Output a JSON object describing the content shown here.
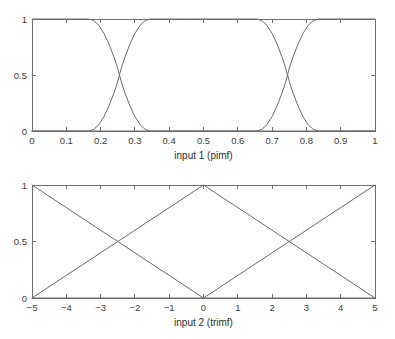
{
  "figure": {
    "background": "#ffffff",
    "line_color": "#6a6a6a",
    "axis_color": "#6f6f6f",
    "text_color": "#3a3a3a",
    "width": 395,
    "height": 339
  },
  "chart_data": [
    {
      "id": "input1",
      "type": "line",
      "title": "",
      "xlabel": "input 1 (pimf)",
      "ylabel": "",
      "xlim": [
        0,
        1
      ],
      "ylim": [
        0,
        1
      ],
      "xticks": [
        0,
        0.1,
        0.2,
        0.3,
        0.4,
        0.5,
        0.6,
        0.7,
        0.8,
        0.9,
        1
      ],
      "xticklabels": [
        "0",
        "0.1",
        "0.2",
        "0.3",
        "0.4",
        "0.5",
        "0.6",
        "0.7",
        "0.8",
        "0.9",
        "1"
      ],
      "yticks": [
        0,
        0.5,
        1
      ],
      "yticklabels": [
        "0",
        "0.5",
        "1"
      ],
      "grid": false,
      "legend": false,
      "mf_type": "pimf",
      "series": [
        {
          "name": "pimf-low",
          "mf_params": [
            -0.35,
            -0.1,
            0.165,
            0.345
          ],
          "points": [
            [
              0.0,
              1.0
            ],
            [
              0.05,
              1.0
            ],
            [
              0.1,
              1.0
            ],
            [
              0.14,
              1.0
            ],
            [
              0.165,
              1.0
            ],
            [
              0.18,
              0.986
            ],
            [
              0.195,
              0.943
            ],
            [
              0.21,
              0.871
            ],
            [
              0.225,
              0.772
            ],
            [
              0.24,
              0.652
            ],
            [
              0.2475,
              0.585
            ],
            [
              0.255,
              0.5
            ],
            [
              0.2625,
              0.418
            ],
            [
              0.27,
              0.348
            ],
            [
              0.285,
              0.228
            ],
            [
              0.3,
              0.129
            ],
            [
              0.315,
              0.057
            ],
            [
              0.33,
              0.014
            ],
            [
              0.345,
              0.0
            ],
            [
              0.4,
              0.0
            ],
            [
              0.5,
              0.0
            ],
            [
              0.7,
              0.0
            ],
            [
              1.0,
              0.0
            ]
          ]
        },
        {
          "name": "pimf-mid",
          "mf_params": [
            0.165,
            0.345,
            0.655,
            0.835
          ],
          "points": [
            [
              0.0,
              0.0
            ],
            [
              0.1,
              0.0
            ],
            [
              0.165,
              0.0
            ],
            [
              0.18,
              0.014
            ],
            [
              0.195,
              0.057
            ],
            [
              0.21,
              0.129
            ],
            [
              0.225,
              0.228
            ],
            [
              0.24,
              0.348
            ],
            [
              0.2475,
              0.418
            ],
            [
              0.255,
              0.5
            ],
            [
              0.2625,
              0.585
            ],
            [
              0.27,
              0.652
            ],
            [
              0.285,
              0.772
            ],
            [
              0.3,
              0.871
            ],
            [
              0.315,
              0.943
            ],
            [
              0.33,
              0.986
            ],
            [
              0.345,
              1.0
            ],
            [
              0.45,
              1.0
            ],
            [
              0.5,
              1.0
            ],
            [
              0.6,
              1.0
            ],
            [
              0.655,
              1.0
            ],
            [
              0.67,
              0.986
            ],
            [
              0.685,
              0.943
            ],
            [
              0.7,
              0.871
            ],
            [
              0.715,
              0.772
            ],
            [
              0.73,
              0.652
            ],
            [
              0.7375,
              0.585
            ],
            [
              0.745,
              0.5
            ],
            [
              0.7525,
              0.418
            ],
            [
              0.76,
              0.348
            ],
            [
              0.775,
              0.228
            ],
            [
              0.79,
              0.129
            ],
            [
              0.805,
              0.057
            ],
            [
              0.82,
              0.014
            ],
            [
              0.835,
              0.0
            ],
            [
              0.9,
              0.0
            ],
            [
              1.0,
              0.0
            ]
          ]
        },
        {
          "name": "pimf-high",
          "mf_params": [
            0.655,
            0.835,
            1.1,
            1.35
          ],
          "points": [
            [
              0.0,
              0.0
            ],
            [
              0.3,
              0.0
            ],
            [
              0.5,
              0.0
            ],
            [
              0.655,
              0.0
            ],
            [
              0.67,
              0.014
            ],
            [
              0.685,
              0.057
            ],
            [
              0.7,
              0.129
            ],
            [
              0.715,
              0.228
            ],
            [
              0.73,
              0.348
            ],
            [
              0.7375,
              0.418
            ],
            [
              0.745,
              0.5
            ],
            [
              0.7525,
              0.585
            ],
            [
              0.76,
              0.652
            ],
            [
              0.775,
              0.772
            ],
            [
              0.79,
              0.871
            ],
            [
              0.805,
              0.943
            ],
            [
              0.82,
              0.986
            ],
            [
              0.835,
              1.0
            ],
            [
              0.9,
              1.0
            ],
            [
              0.95,
              1.0
            ],
            [
              1.0,
              1.0
            ]
          ]
        }
      ]
    },
    {
      "id": "input2",
      "type": "line",
      "title": "",
      "xlabel": "input 2 (trimf)",
      "ylabel": "",
      "xlim": [
        -5,
        5
      ],
      "ylim": [
        0,
        1
      ],
      "xticks": [
        -5,
        -4,
        -3,
        -2,
        -1,
        0,
        1,
        2,
        3,
        4,
        5
      ],
      "xticklabels": [
        "−5",
        "−4",
        "−3",
        "−2",
        "−1",
        "0",
        "1",
        "2",
        "3",
        "4",
        "5"
      ],
      "yticks": [
        0,
        0.5,
        1
      ],
      "yticklabels": [
        "0",
        "0.5",
        "1"
      ],
      "grid": false,
      "legend": false,
      "mf_type": "trimf",
      "series": [
        {
          "name": "trimf-low",
          "mf_params": [
            -10,
            -5,
            0
          ],
          "points": [
            [
              -5,
              1.0
            ],
            [
              -2.5,
              0.5
            ],
            [
              0,
              0.0
            ],
            [
              5,
              0.0
            ]
          ]
        },
        {
          "name": "trimf-mid",
          "mf_params": [
            -5,
            0,
            5
          ],
          "points": [
            [
              -5,
              0.0
            ],
            [
              -2.5,
              0.5
            ],
            [
              0,
              1.0
            ],
            [
              2.5,
              0.5
            ],
            [
              5,
              0.0
            ]
          ]
        },
        {
          "name": "trimf-high",
          "mf_params": [
            0,
            5,
            10
          ],
          "points": [
            [
              -5,
              0.0
            ],
            [
              0,
              0.0
            ],
            [
              2.5,
              0.5
            ],
            [
              5,
              1.0
            ]
          ]
        }
      ]
    }
  ]
}
